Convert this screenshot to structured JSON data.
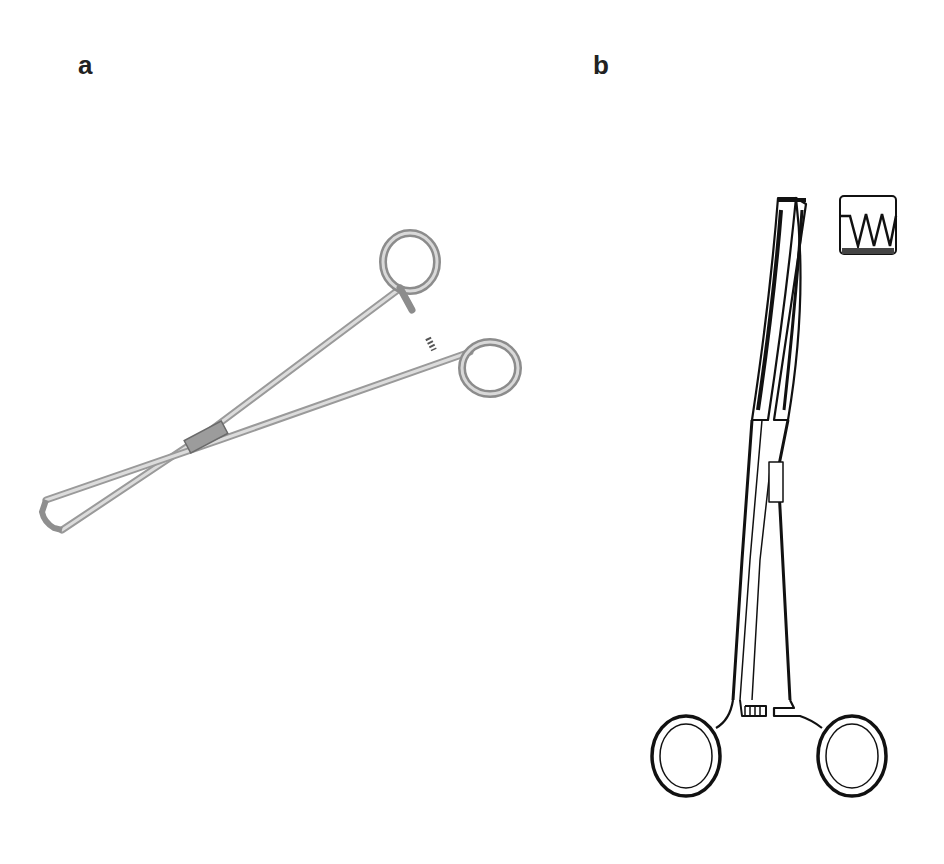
{
  "figure": {
    "panels": [
      {
        "label": "a",
        "description": "photograph of forceps with looped tips, grey metallic, open handles"
      },
      {
        "label": "b",
        "description": "line drawing of curved forceps with serrated jaw detail inset"
      }
    ],
    "inset": {
      "description": "jaw serration detail",
      "teeth": 3
    },
    "colors": {
      "background": "#ffffff",
      "metal_light": "#d8d8d8",
      "metal_dark": "#7a7a7a",
      "ink": "#111111"
    }
  }
}
